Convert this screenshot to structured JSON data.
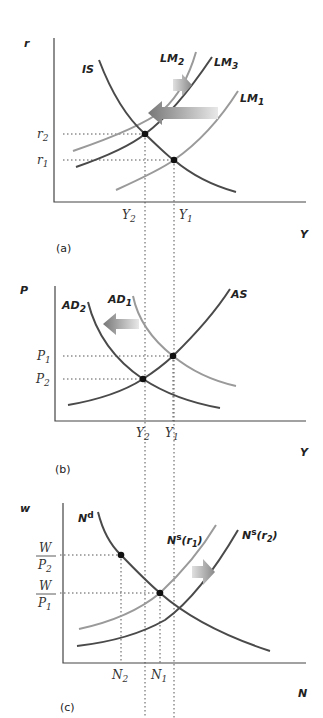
{
  "figure": {
    "panels": [
      {
        "id": "a",
        "caption": "(a)",
        "y_axis_label": "r",
        "x_axis_label": "Y",
        "curves": [
          {
            "name": "IS",
            "label_main": "IS",
            "label_sub": "",
            "style": "dark"
          },
          {
            "name": "LM2",
            "label_main": "LM",
            "label_sub": "2",
            "style": "light"
          },
          {
            "name": "LM3",
            "label_main": "LM",
            "label_sub": "3",
            "style": "dark"
          },
          {
            "name": "LM1",
            "label_main": "LM",
            "label_sub": "1",
            "style": "light"
          }
        ],
        "y_ticks": [
          {
            "main": "r",
            "sub": "2"
          },
          {
            "main": "r",
            "sub": "1"
          }
        ],
        "x_ticks": [
          {
            "main": "Y",
            "sub": "2"
          },
          {
            "main": "Y",
            "sub": "1"
          }
        ],
        "arrows": [
          {
            "direction": "left",
            "from": "LM1",
            "to": "LM2",
            "size": "large"
          },
          {
            "direction": "right",
            "from": "LM2",
            "to": "LM3",
            "size": "small"
          }
        ]
      },
      {
        "id": "b",
        "caption": "(b)",
        "y_axis_label": "P",
        "x_axis_label": "Y",
        "curves": [
          {
            "name": "AD2",
            "label_main": "AD",
            "label_sub": "2",
            "style": "dark"
          },
          {
            "name": "AD1",
            "label_main": "AD",
            "label_sub": "1",
            "style": "light"
          },
          {
            "name": "AS",
            "label_main": "AS",
            "label_sub": "",
            "style": "dark"
          }
        ],
        "y_ticks": [
          {
            "main": "P",
            "sub": "1"
          },
          {
            "main": "P",
            "sub": "2"
          }
        ],
        "x_ticks": [
          {
            "main": "Y",
            "sub": "2"
          },
          {
            "main": "Y",
            "sub": "1"
          }
        ],
        "arrows": [
          {
            "direction": "left",
            "from": "AD1",
            "to": "AD2",
            "size": "medium"
          }
        ]
      },
      {
        "id": "c",
        "caption": "(c)",
        "y_axis_label": "w",
        "x_axis_label": "N",
        "curves": [
          {
            "name": "Nd",
            "label_main": "N",
            "label_sup": "d",
            "style": "dark"
          },
          {
            "name": "Ns(r1)",
            "label_main": "N",
            "label_sup": "s",
            "label_paren": "(r",
            "label_sub": "1",
            "label_close": ")",
            "style": "light"
          },
          {
            "name": "Ns(r2)",
            "label_main": "N",
            "label_sup": "s",
            "label_paren": "(r",
            "label_sub": "2",
            "label_close": ")",
            "style": "dark"
          }
        ],
        "y_ticks": [
          {
            "num": "W",
            "den_main": "P",
            "den_sub": "2"
          },
          {
            "num": "W",
            "den_main": "P",
            "den_sub": "1"
          }
        ],
        "x_ticks": [
          {
            "main": "N",
            "sub": "2"
          },
          {
            "main": "N",
            "sub": "1"
          }
        ],
        "arrows": [
          {
            "direction": "right",
            "from": "Ns(r1)",
            "to": "Ns(r2)",
            "size": "small"
          }
        ]
      }
    ]
  }
}
